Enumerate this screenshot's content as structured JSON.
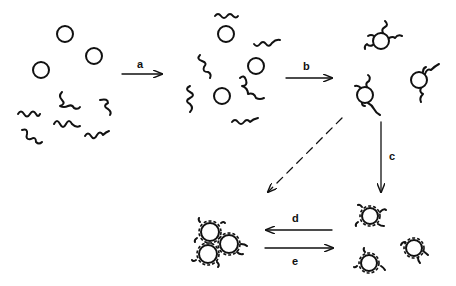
{
  "diagram": {
    "type": "reaction-scheme",
    "stages": [
      {
        "id": "stage-1",
        "label": "separate particles and polymer chains"
      },
      {
        "id": "stage-2",
        "label": "mixed particles and chains"
      },
      {
        "id": "stage-3",
        "label": "particles with partially adsorbed chains"
      },
      {
        "id": "stage-4",
        "label": "particles fully coated by adsorbed chains"
      },
      {
        "id": "stage-5",
        "label": "aggregated cluster of coated particles"
      }
    ],
    "arrows": [
      {
        "id": "a",
        "label": "a",
        "from": "stage-1",
        "to": "stage-2",
        "style": "solid"
      },
      {
        "id": "b",
        "label": "b",
        "from": "stage-2",
        "to": "stage-3",
        "style": "solid"
      },
      {
        "id": "c",
        "label": "c",
        "from": "stage-3",
        "to": "stage-4",
        "style": "solid"
      },
      {
        "id": "dashed",
        "label": "",
        "from": "stage-3",
        "to": "stage-5",
        "style": "dashed"
      },
      {
        "id": "d",
        "label": "d",
        "from": "stage-4",
        "to": "stage-5",
        "style": "solid"
      },
      {
        "id": "e",
        "label": "e",
        "from": "stage-5",
        "to": "stage-4",
        "style": "solid"
      }
    ]
  }
}
